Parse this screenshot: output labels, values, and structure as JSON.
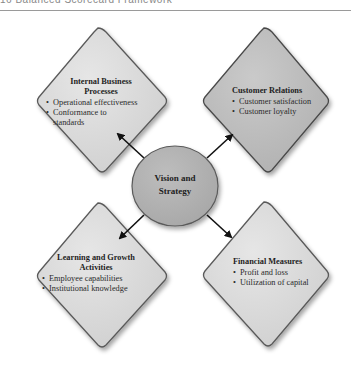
{
  "header": {
    "title": "16   Balanced Scorecard Framework"
  },
  "center": {
    "line1": "Vision and",
    "line2": "Strategy"
  },
  "quadrants": [
    {
      "title_line1": "Internal Business",
      "title_line2": "Processes",
      "items": [
        "Operational effectiveness",
        "Conformance to",
        "standards"
      ]
    },
    {
      "title_line1": "Customer Relations",
      "title_line2": "",
      "items": [
        "Customer satisfaction",
        "Customer loyalty"
      ]
    },
    {
      "title_line1": "Learning and Growth",
      "title_line2": "Activities",
      "items": [
        "Employee capabilities",
        "Institutional knowledge"
      ]
    },
    {
      "title_line1": "Financial Measures",
      "title_line2": "",
      "items": [
        "Profit and loss",
        "Utilization of capital"
      ]
    }
  ],
  "colors": {
    "diamond_light": "#dcdcdc",
    "diamond_dark": "#bdbdbd",
    "circle": "#b3b3b3",
    "stroke": "#555555"
  }
}
